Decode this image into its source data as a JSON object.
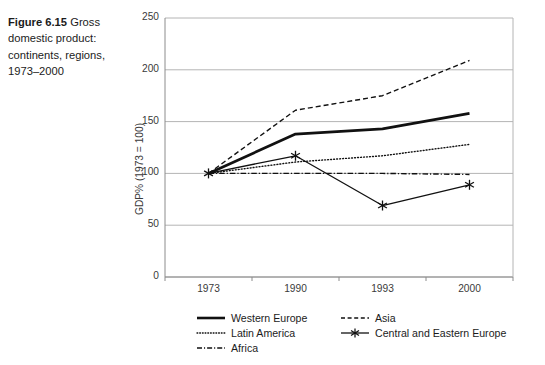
{
  "caption": {
    "label": "Figure 6.15",
    "text": " Gross domestic product: continents, regions, 1973–2000"
  },
  "chart_data": {
    "type": "line",
    "title": "Gross domestic product: continents, regions, 1973–2000",
    "xlabel": "",
    "ylabel": "GDP% (1973 = 100)",
    "categories": [
      "1973",
      "1990",
      "1993",
      "2000"
    ],
    "ylim": [
      0,
      250
    ],
    "yticks": [
      "0",
      "50",
      "100",
      "150",
      "200",
      "250"
    ],
    "grid": "horizontal",
    "legend_position": "bottom",
    "series": [
      {
        "name": "Western Europe",
        "values": [
          100,
          138,
          143,
          158
        ],
        "style": "solid-thick",
        "color": "#111111",
        "marker": "none"
      },
      {
        "name": "Asia",
        "values": [
          100,
          161,
          175,
          209
        ],
        "style": "dashed",
        "color": "#111111",
        "marker": "none"
      },
      {
        "name": "Latin America",
        "values": [
          100,
          111,
          117,
          128
        ],
        "style": "dotted",
        "color": "#111111",
        "marker": "none"
      },
      {
        "name": "Central and Eastern Europe",
        "values": [
          100,
          117,
          69,
          89
        ],
        "style": "solid-thin",
        "color": "#111111",
        "marker": "asterisk"
      },
      {
        "name": "Africa",
        "values": [
          100,
          100,
          100,
          99
        ],
        "style": "dash-dot",
        "color": "#111111",
        "marker": "none"
      }
    ]
  },
  "legend": {
    "entries": [
      {
        "label": "Western Europe"
      },
      {
        "label": "Asia"
      },
      {
        "label": "Latin America"
      },
      {
        "label": "Central and Eastern Europe"
      },
      {
        "label": "Africa"
      }
    ]
  }
}
